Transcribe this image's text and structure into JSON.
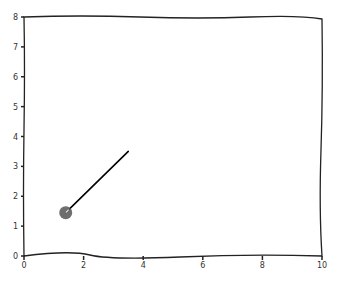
{
  "chart_data": {
    "type": "line",
    "title": "",
    "xlabel": "",
    "ylabel": "",
    "xlim": [
      0,
      10
    ],
    "ylim": [
      0,
      8
    ],
    "grid": false,
    "style": "xkcd",
    "x_ticks": [
      "0",
      "2",
      "4",
      "6",
      "8",
      "10"
    ],
    "y_ticks": [
      "0",
      "1",
      "2",
      "3",
      "4",
      "5",
      "6",
      "7",
      "8"
    ],
    "series": [
      {
        "name": "segment",
        "type": "line",
        "x": [
          1.4,
          3.5
        ],
        "y": [
          1.45,
          3.5
        ],
        "color": "#000000"
      },
      {
        "name": "point",
        "type": "scatter",
        "x": [
          1.4
        ],
        "y": [
          1.45
        ],
        "color": "#555555",
        "marker_size": "large"
      }
    ]
  }
}
